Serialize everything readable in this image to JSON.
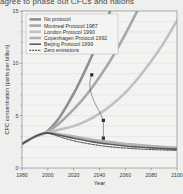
{
  "caption": {
    "text": "agree to phase out CFCs and halons"
  },
  "figure": {
    "name": "cfc-concentration-projection-chart"
  },
  "chart_data": {
    "type": "line",
    "title": "",
    "xlabel": "Year",
    "ylabel": "CFC concentration (parts per billion)",
    "xlim": [
      1980,
      2100
    ],
    "ylim": [
      0,
      15
    ],
    "xticks": [
      1980,
      2000,
      2020,
      2040,
      2060,
      2080,
      2100
    ],
    "yticks": [
      0,
      5,
      10,
      15
    ],
    "grid": "horizontal-faint",
    "legend_position": "top-left-inside",
    "x": [
      1980,
      1990,
      1998,
      2005,
      2010,
      2020,
      2030,
      2040,
      2050,
      2060,
      2070,
      2080,
      2090,
      2100
    ],
    "series": [
      {
        "name": "No protocol",
        "label": "No protocol",
        "color": "#8f8f8f",
        "width": 2.6,
        "dash": "none",
        "values": [
          2.3,
          3.0,
          3.35,
          4.2,
          5.0,
          7.1,
          9.6,
          12.4,
          15.6,
          19.2,
          23.2,
          27.6,
          32.4,
          37.6
        ]
      },
      {
        "name": "Montreal Protocol 1987",
        "label": "Montreal Protocol 1987",
        "color": "#a8a8a8",
        "width": 2.6,
        "dash": "none",
        "values": [
          2.3,
          3.0,
          3.35,
          3.9,
          4.4,
          5.6,
          7.0,
          8.7,
          10.6,
          12.8,
          15.2,
          17.9,
          20.8,
          24.0
        ]
      },
      {
        "name": "London Protocol 1990",
        "label": "London Protocol 1990",
        "color": "#c0c0c0",
        "width": 2.6,
        "dash": "none",
        "values": [
          2.3,
          3.0,
          3.35,
          3.55,
          3.7,
          4.0,
          4.5,
          5.2,
          6.1,
          7.2,
          8.6,
          10.2,
          12.0,
          14.1
        ]
      },
      {
        "name": "Copenhagen Protocol 1992",
        "label": "Copenhagen Protocol 1992",
        "color": "#b2b2b2",
        "width": 2.6,
        "dash": "none",
        "values": [
          2.3,
          3.0,
          3.35,
          3.3,
          3.2,
          3.0,
          2.8,
          2.6,
          2.45,
          2.3,
          2.2,
          2.1,
          2.0,
          1.95
        ]
      },
      {
        "name": "Beijing Protocol 1999",
        "label": "Beijing Protocol 1999",
        "color": "#5a5a5a",
        "width": 1.6,
        "dash": "none",
        "values": [
          2.3,
          3.0,
          3.35,
          3.25,
          3.1,
          2.85,
          2.6,
          2.4,
          2.25,
          2.1,
          2.0,
          1.92,
          1.85,
          1.8
        ]
      },
      {
        "name": "Zero emissions",
        "label": "Zero emissions",
        "color": "#3c3c3c",
        "width": 1.0,
        "dash": "1.6,1.2",
        "values": [
          2.3,
          3.0,
          3.35,
          3.15,
          2.95,
          2.6,
          2.35,
          2.15,
          2.0,
          1.9,
          1.82,
          1.76,
          1.72,
          1.68
        ]
      }
    ],
    "annotations": [
      {
        "name": "annotation-marker-upper",
        "x": 2034,
        "y": 8.9
      },
      {
        "name": "annotation-marker-middle",
        "x": 2043,
        "y": 4.55
      },
      {
        "name": "annotation-marker-lower",
        "x": 2043,
        "y": 2.85
      }
    ]
  }
}
